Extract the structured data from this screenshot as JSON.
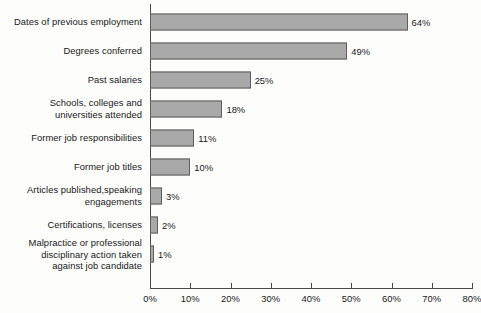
{
  "chart_data": {
    "type": "bar",
    "orientation": "horizontal",
    "title": "",
    "xlabel": "",
    "ylabel": "",
    "xlim": [
      0,
      80
    ],
    "grid": false,
    "legend": false,
    "axis_tick_labels": [
      "0%",
      "10%",
      "20%",
      "30%",
      "40%",
      "50%",
      "60%",
      "70%",
      "80%"
    ],
    "axis_ticks": [
      0,
      10,
      20,
      30,
      40,
      50,
      60,
      70,
      80
    ],
    "categories": [
      "Dates of previous employment",
      "Degrees conferred",
      "Past salaries",
      "Schools, colleges and\nuniversities attended",
      "Former job responsibilities",
      "Former job titles",
      "Articles published,speaking\nengagements",
      "Certifications, licenses",
      "Malpractice or professional\ndisciplinary action taken\nagainst job candidate"
    ],
    "values": [
      64,
      49,
      25,
      18,
      11,
      10,
      3,
      2,
      1
    ],
    "value_labels": [
      "64%",
      "49%",
      "25%",
      "18%",
      "11%",
      "10%",
      "3%",
      "2%",
      "1%"
    ],
    "bar_fill_color": "#a9a9a9",
    "bar_border_color": "#5d5d5d",
    "axis_color": "#4a4a4a",
    "background_color": "#fdfdfc"
  }
}
